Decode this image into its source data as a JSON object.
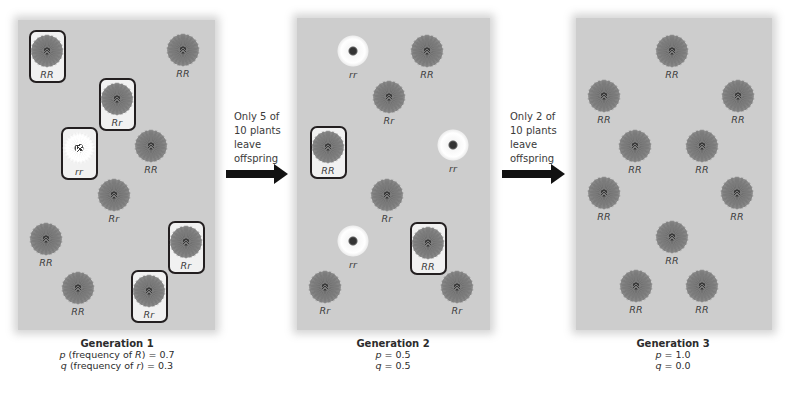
{
  "colors": {
    "panel_bg": "#cdcdcd",
    "red_flower": "#7b7b7b",
    "white_flower": "#ffffff",
    "box_border": "#231f20",
    "arrow": "#111111"
  },
  "generations": [
    {
      "title": "Generation 1",
      "p_line": {
        "symbol": "p",
        "text": " (frequency of ",
        "allele": "R",
        "close": ") = 0.7"
      },
      "q_line": {
        "symbol": "q",
        "text": " (frequency of ",
        "allele": "r",
        "close": ") = 0.3"
      },
      "p": 0.7,
      "q": 0.3,
      "plants": [
        {
          "genotype": "RR",
          "color": "red",
          "boxed": true
        },
        {
          "genotype": "RR",
          "color": "red",
          "boxed": false
        },
        {
          "genotype": "Rr",
          "color": "red",
          "boxed": true
        },
        {
          "genotype": "rr",
          "color": "white",
          "boxed": true
        },
        {
          "genotype": "RR",
          "color": "red",
          "boxed": false
        },
        {
          "genotype": "Rr",
          "color": "red",
          "boxed": false
        },
        {
          "genotype": "RR",
          "color": "red",
          "boxed": false
        },
        {
          "genotype": "Rr",
          "color": "red",
          "boxed": true
        },
        {
          "genotype": "RR",
          "color": "red",
          "boxed": false
        },
        {
          "genotype": "Rr",
          "color": "red",
          "boxed": true
        }
      ]
    },
    {
      "title": "Generation 2",
      "p_line": {
        "symbol": "p",
        "close": " = 0.5"
      },
      "q_line": {
        "symbol": "q",
        "close": " = 0.5"
      },
      "p": 0.5,
      "q": 0.5,
      "plants": [
        {
          "genotype": "rr",
          "color": "white",
          "boxed": false
        },
        {
          "genotype": "RR",
          "color": "red",
          "boxed": false
        },
        {
          "genotype": "Rr",
          "color": "red",
          "boxed": false
        },
        {
          "genotype": "RR",
          "color": "red",
          "boxed": true
        },
        {
          "genotype": "rr",
          "color": "white",
          "boxed": false
        },
        {
          "genotype": "Rr",
          "color": "red",
          "boxed": false
        },
        {
          "genotype": "rr",
          "color": "white",
          "boxed": false
        },
        {
          "genotype": "RR",
          "color": "red",
          "boxed": true
        },
        {
          "genotype": "Rr",
          "color": "red",
          "boxed": false
        },
        {
          "genotype": "Rr",
          "color": "red",
          "boxed": false
        }
      ]
    },
    {
      "title": "Generation 3",
      "p_line": {
        "symbol": "p",
        "close": " = 1.0"
      },
      "q_line": {
        "symbol": "q",
        "close": " = 0.0"
      },
      "p": 1.0,
      "q": 0.0,
      "plants": [
        {
          "genotype": "RR",
          "color": "red",
          "boxed": false
        },
        {
          "genotype": "RR",
          "color": "red",
          "boxed": false
        },
        {
          "genotype": "RR",
          "color": "red",
          "boxed": false
        },
        {
          "genotype": "RR",
          "color": "red",
          "boxed": false
        },
        {
          "genotype": "RR",
          "color": "red",
          "boxed": false
        },
        {
          "genotype": "RR",
          "color": "red",
          "boxed": false
        },
        {
          "genotype": "RR",
          "color": "red",
          "boxed": false
        },
        {
          "genotype": "RR",
          "color": "red",
          "boxed": false
        },
        {
          "genotype": "RR",
          "color": "red",
          "boxed": false
        },
        {
          "genotype": "RR",
          "color": "red",
          "boxed": false
        }
      ]
    }
  ],
  "transitions": [
    {
      "lines": [
        "Only 5 of",
        "10 plants",
        "leave",
        "offspring"
      ]
    },
    {
      "lines": [
        "Only 2 of",
        "10 plants",
        "leave",
        "offspring"
      ]
    }
  ]
}
